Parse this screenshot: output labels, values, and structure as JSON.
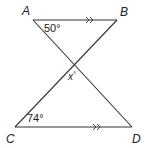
{
  "diagram": {
    "type": "geometry",
    "points": {
      "A": {
        "label": "A",
        "x": 33,
        "y": 20
      },
      "B": {
        "label": "B",
        "x": 117,
        "y": 20
      },
      "C": {
        "label": "C",
        "x": 15,
        "y": 127
      },
      "D": {
        "label": "D",
        "x": 132,
        "y": 127
      },
      "X": {
        "label": "",
        "x": 73,
        "y": 65
      }
    },
    "segments": [
      "AB",
      "CD",
      "AD",
      "BC"
    ],
    "parallel_marks": {
      "AB": ">>",
      "CD": ">>"
    },
    "angles": {
      "A": {
        "label": "50°",
        "value": 50
      },
      "C": {
        "label": "74°",
        "value": 74
      },
      "X": {
        "label": "x°",
        "var": "x"
      }
    },
    "labels": {
      "A": "A",
      "B": "B",
      "C": "C",
      "D": "D",
      "angle_A": "50°",
      "angle_C": "74°",
      "angle_x_var": "x",
      "angle_x_deg": "°"
    },
    "colors": {
      "line": "#333333",
      "text": "#222222",
      "background": "#ffffff"
    }
  }
}
